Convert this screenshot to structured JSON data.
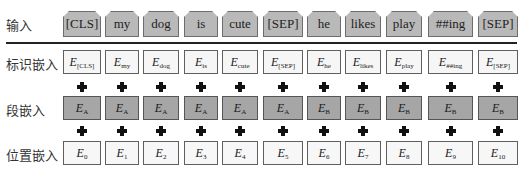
{
  "rows": {
    "input_label": "输入",
    "token_label": "标识嵌入",
    "segment_label": "段嵌入",
    "position_label": "位置嵌入"
  },
  "columns": [
    {
      "x": 63,
      "w": 38,
      "input": "[CLS]",
      "token_sub": "[CLS]",
      "segment_sub": "A",
      "position_sub": "0"
    },
    {
      "x": 105,
      "w": 34,
      "input": "my",
      "token_sub": "my",
      "segment_sub": "A",
      "position_sub": "1"
    },
    {
      "x": 143,
      "w": 36,
      "input": "dog",
      "token_sub": "dog",
      "segment_sub": "A",
      "position_sub": "2"
    },
    {
      "x": 184,
      "w": 34,
      "input": "is",
      "token_sub": "is",
      "segment_sub": "A",
      "position_sub": "3"
    },
    {
      "x": 222,
      "w": 36,
      "input": "cute",
      "token_sub": "cute",
      "segment_sub": "A",
      "position_sub": "4"
    },
    {
      "x": 263,
      "w": 40,
      "input": "[SEP]",
      "token_sub": "[SEP]",
      "segment_sub": "A",
      "position_sub": "5"
    },
    {
      "x": 307,
      "w": 34,
      "input": "he",
      "token_sub": "he",
      "segment_sub": "B",
      "position_sub": "6"
    },
    {
      "x": 345,
      "w": 36,
      "input": "likes",
      "token_sub": "likes",
      "segment_sub": "B",
      "position_sub": "7"
    },
    {
      "x": 386,
      "w": 36,
      "input": "play",
      "token_sub": "play",
      "segment_sub": "B",
      "position_sub": "8"
    },
    {
      "x": 428,
      "w": 45,
      "input": "##ing",
      "token_sub": "##ing",
      "segment_sub": "B",
      "position_sub": "9"
    },
    {
      "x": 478,
      "w": 40,
      "input": "[SEP]",
      "token_sub": "[SEP]",
      "segment_sub": "B",
      "position_sub": "10"
    }
  ],
  "embedding_symbol": "E",
  "colors": {
    "input_fill": "#b9b9b9",
    "segment_fill": "#a6a6a6",
    "token_fill": "#f6f6f6",
    "position_fill": "#f7f7f7"
  }
}
